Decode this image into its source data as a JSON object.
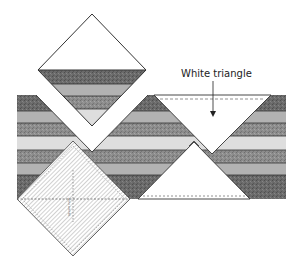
{
  "diagram": {
    "annotation": {
      "label": "White triangle",
      "points_to": "inverted white triangle placed on strip set"
    },
    "ruler_marking": "square ruler",
    "colors": {
      "dark": "#6a6a6a",
      "medium": "#b2b2b2",
      "texture": "#8c8c8c",
      "light": "#dedede",
      "white": "#ffffff",
      "outline": "#333333",
      "ruler_hatch": "#9a9a9a"
    },
    "strip_bands": [
      {
        "name": "dark",
        "y1": 95,
        "y2": 111
      },
      {
        "name": "medium",
        "y1": 111,
        "y2": 123
      },
      {
        "name": "texture",
        "y1": 123,
        "y2": 136
      },
      {
        "name": "light",
        "y1": 136,
        "y2": 150
      },
      {
        "name": "texture",
        "y1": 150,
        "y2": 163
      },
      {
        "name": "medium",
        "y1": 163,
        "y2": 175
      },
      {
        "name": "dark",
        "y1": 175,
        "y2": 199
      }
    ],
    "elements": [
      "cut-square-diamond",
      "strip-set",
      "white-triangle-inverted",
      "white-triangle-upright",
      "square-ruler-diamond"
    ]
  }
}
